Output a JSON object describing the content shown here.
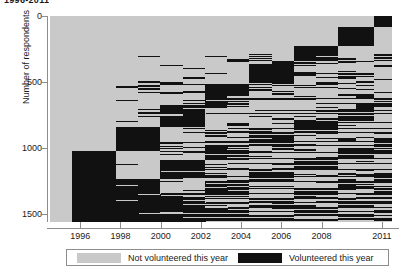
{
  "title": "1996-2011",
  "axes": {
    "ylabel": "Number of respondents",
    "yticks": [
      0,
      500,
      1000,
      1500
    ],
    "ylim": [
      0,
      1560
    ],
    "xticks": [
      "1996",
      "1998",
      "2000",
      "2002",
      "2004",
      "2006",
      "2008",
      "2011"
    ],
    "xlim": [
      1995,
      2012
    ]
  },
  "legend": {
    "items": [
      {
        "label": "Not volunteered this year",
        "color": "#c9c9c9",
        "name": "not-volunteered"
      },
      {
        "label": "Volunteered this year",
        "color": "#111111",
        "name": "volunteered"
      }
    ]
  },
  "colors": {
    "not_volunteered": "#c9c9c9",
    "volunteered": "#111111",
    "axis": "#8d8d8d",
    "text": "#1a1a1a",
    "background": "#ffffff"
  },
  "chart_data": {
    "type": "heatmap",
    "title": "1996-2011",
    "xlabel": "",
    "ylabel": "Number of respondents",
    "legend_position": "bottom",
    "grid": false,
    "n_respondents": 1560,
    "years": [
      1995,
      1996,
      1997,
      1998,
      1999,
      2000,
      2001,
      2002,
      2003,
      2004,
      2005,
      2006,
      2007,
      2008,
      2009,
      2010,
      2011,
      2012
    ],
    "xtick_labels": [
      "1996",
      "1998",
      "2000",
      "2002",
      "2004",
      "2006",
      "2008",
      "2011"
    ],
    "xtick_years": [
      1996,
      1998,
      2000,
      2002,
      2004,
      2006,
      2008,
      2011
    ],
    "ytick_values": [
      0,
      500,
      1000,
      1500
    ],
    "categories": [
      "Not volunteered this year",
      "Volunteered this year"
    ],
    "category_colors": [
      "#c9c9c9",
      "#111111"
    ],
    "column_fractions_volunteered": [
      0.0,
      0.3,
      0.3,
      0.22,
      0.22,
      0.26,
      0.26,
      0.3,
      0.3,
      0.33,
      0.33,
      0.38,
      0.38,
      0.42,
      0.42,
      0.46,
      0.5,
      0.5
    ],
    "columns": [
      {
        "year": 1995,
        "x_frac": [
          0.0,
          0.063
        ],
        "bands": []
      },
      {
        "year": 1996,
        "x_frac": [
          0.063,
          0.128
        ],
        "bands": [
          [
            0.655,
            1.0
          ]
        ]
      },
      {
        "year": 1997,
        "x_frac": [
          0.128,
          0.193
        ],
        "bands": [
          [
            0.655,
            1.0
          ]
        ]
      },
      {
        "year": 1998,
        "x_frac": [
          0.193,
          0.258
        ],
        "bands": [
          [
            0.54,
            0.655
          ],
          [
            0.79,
            1.0
          ]
        ]
      },
      {
        "year": 1999,
        "x_frac": [
          0.258,
          0.323
        ],
        "bands": [
          [
            0.54,
            0.655
          ],
          [
            0.79,
            1.0
          ]
        ]
      },
      {
        "year": 2000,
        "x_frac": [
          0.323,
          0.388
        ],
        "bands": [
          [
            0.43,
            0.54
          ],
          [
            0.7,
            0.79
          ],
          [
            0.88,
            1.0
          ]
        ]
      },
      {
        "year": 2001,
        "x_frac": [
          0.388,
          0.453
        ],
        "bands": [
          [
            0.43,
            0.54
          ],
          [
            0.7,
            0.79
          ],
          [
            0.88,
            1.0
          ]
        ]
      },
      {
        "year": 2002,
        "x_frac": [
          0.453,
          0.518
        ],
        "bands": [
          [
            0.33,
            0.43
          ],
          [
            0.625,
            0.7
          ],
          [
            0.8,
            0.88
          ],
          [
            0.93,
            1.0
          ]
        ]
      },
      {
        "year": 2003,
        "x_frac": [
          0.518,
          0.583
        ],
        "bands": [
          [
            0.33,
            0.43
          ],
          [
            0.625,
            0.7
          ],
          [
            0.8,
            0.88
          ],
          [
            0.93,
            1.0
          ]
        ]
      },
      {
        "year": 2004,
        "x_frac": [
          0.583,
          0.648
        ],
        "bands": [
          [
            0.235,
            0.33
          ],
          [
            0.565,
            0.625
          ],
          [
            0.745,
            0.8
          ],
          [
            0.885,
            0.93
          ],
          [
            0.965,
            1.0
          ]
        ]
      },
      {
        "year": 2005,
        "x_frac": [
          0.648,
          0.713
        ],
        "bands": [
          [
            0.235,
            0.33
          ],
          [
            0.565,
            0.625
          ],
          [
            0.745,
            0.8
          ],
          [
            0.885,
            0.93
          ],
          [
            0.965,
            1.0
          ]
        ]
      },
      {
        "year": 2006,
        "x_frac": [
          0.713,
          0.778
        ],
        "bands": [
          [
            0.145,
            0.235
          ],
          [
            0.505,
            0.565
          ],
          [
            0.69,
            0.745
          ],
          [
            0.84,
            0.885
          ],
          [
            0.93,
            0.965
          ],
          [
            0.985,
            1.0
          ]
        ]
      },
      {
        "year": 2007,
        "x_frac": [
          0.778,
          0.843
        ],
        "bands": [
          [
            0.145,
            0.235
          ],
          [
            0.505,
            0.565
          ],
          [
            0.69,
            0.745
          ],
          [
            0.84,
            0.885
          ],
          [
            0.93,
            0.965
          ],
          [
            0.985,
            1.0
          ]
        ]
      },
      {
        "year": 2008,
        "x_frac": [
          0.843,
          0.895
        ],
        "bands": [
          [
            0.055,
            0.145
          ],
          [
            0.45,
            0.505
          ],
          [
            0.64,
            0.69
          ],
          [
            0.8,
            0.84
          ],
          [
            0.9,
            0.93
          ],
          [
            0.96,
            0.985
          ]
        ]
      },
      {
        "year": 2009,
        "x_frac": [
          0.895,
          0.947
        ],
        "bands": [
          [
            0.055,
            0.145
          ],
          [
            0.45,
            0.505
          ],
          [
            0.64,
            0.69
          ],
          [
            0.8,
            0.84
          ],
          [
            0.9,
            0.93
          ],
          [
            0.96,
            0.985
          ]
        ]
      },
      {
        "year": 2010,
        "x_frac": [
          0.947,
          1.0
        ],
        "bands": [
          [
            0.0,
            0.055
          ],
          [
            0.4,
            0.45
          ],
          [
            0.595,
            0.64
          ],
          [
            0.76,
            0.8
          ],
          [
            0.87,
            0.9
          ],
          [
            0.94,
            0.96
          ],
          [
            0.98,
            1.0
          ]
        ]
      }
    ]
  }
}
